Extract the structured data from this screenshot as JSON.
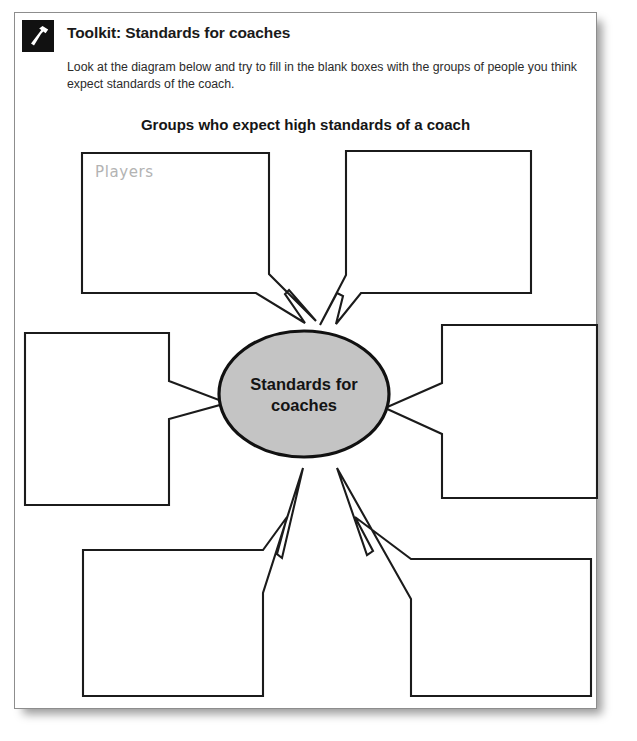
{
  "page": {
    "background_color": "#ffffff",
    "card_color": "#ffffff",
    "border_color": "#8d8d8d"
  },
  "header": {
    "icon": "hammer-icon",
    "title": "Toolkit: Standards for coaches",
    "instructions": "Look at the diagram below and try to fill in the blank boxes with the groups of people you think expect standards of the coach."
  },
  "diagram": {
    "title": "Groups who expect high standards of a coach",
    "hub": {
      "label_line1": "Standards for",
      "label_line2": "coaches",
      "fill_color": "#c4c4c4",
      "stroke_color": "#111111"
    },
    "boxes": [
      {
        "id": "box-top-left",
        "position": "top-left",
        "answer": "Players",
        "filled": true
      },
      {
        "id": "box-top-right",
        "position": "top-right",
        "answer": "",
        "filled": false
      },
      {
        "id": "box-middle-left",
        "position": "middle-left",
        "answer": "",
        "filled": false
      },
      {
        "id": "box-middle-right",
        "position": "middle-right",
        "answer": "",
        "filled": false
      },
      {
        "id": "box-bottom-left",
        "position": "bottom-left",
        "answer": "",
        "filled": false
      },
      {
        "id": "box-bottom-right",
        "position": "bottom-right",
        "answer": "",
        "filled": false
      }
    ]
  }
}
